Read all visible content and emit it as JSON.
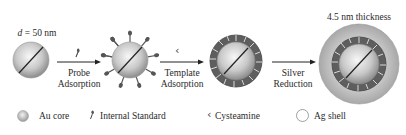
{
  "diagram": {
    "stages": [
      {
        "id": "au-core",
        "label": "d = 50 nm",
        "label_italic_prefix": "d",
        "label_rest": " = 50 nm"
      },
      {
        "id": "probe-adsorbed"
      },
      {
        "id": "template-adsorbed"
      },
      {
        "id": "ag-shell",
        "label": "4.5 nm thickness"
      }
    ],
    "steps": [
      {
        "line1": "Probe",
        "line2": "Adsorption",
        "reagent_icon": "internal-standard-icon"
      },
      {
        "line1": "Template",
        "line2": "Adsorption",
        "reagent_icon": "cysteamine-icon"
      },
      {
        "line1": "Silver",
        "line2": "Reduction",
        "reagent_icon": null
      }
    ],
    "legend": [
      {
        "icon": "au-core-icon",
        "label": "Au core"
      },
      {
        "icon": "internal-standard-icon",
        "label": "Internal Standard"
      },
      {
        "icon": "cysteamine-icon",
        "label": "Cysteamine"
      },
      {
        "icon": "ag-shell-icon",
        "label": "Ag shell"
      }
    ],
    "colors": {
      "core_light": "#f4f4f4",
      "core_dark": "#8e8e8e",
      "template_ring": "#5e5e5e",
      "ag_shell": "#b9b9b9",
      "arrow": "#222222"
    }
  }
}
